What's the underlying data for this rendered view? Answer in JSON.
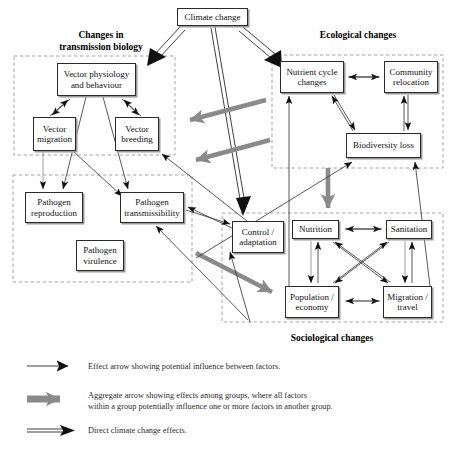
{
  "diagram": {
    "title_box": {
      "label": "Climate change"
    },
    "group_labels": {
      "transmission": "Changes in\ntransmission biology",
      "ecological": "Ecological changes",
      "sociological": "Sociological changes"
    },
    "nodes": [
      {
        "id": "climate-change",
        "label": "Climate change",
        "x": 177,
        "y": 8,
        "w": 71,
        "h": 18,
        "shadow": true
      },
      {
        "id": "vector-physiology",
        "label": "Vector physiology\nand behaviour",
        "x": 57,
        "y": 63,
        "w": 79,
        "h": 33,
        "shadow": true
      },
      {
        "id": "vector-migration",
        "label": "Vector\nmigration",
        "x": 33,
        "y": 117,
        "w": 43,
        "h": 34,
        "shadow": true
      },
      {
        "id": "vector-breeding",
        "label": "Vector\nbreeding",
        "x": 115,
        "y": 117,
        "w": 44,
        "h": 34,
        "shadow": true
      },
      {
        "id": "pathogen-reproduction",
        "label": "Pathogen\nreproduction",
        "x": 25,
        "y": 192,
        "w": 58,
        "h": 31,
        "shadow": true
      },
      {
        "id": "pathogen-transmissibility",
        "label": "Pathogen\ntransmissibility",
        "x": 120,
        "y": 192,
        "w": 64,
        "h": 31,
        "shadow": true
      },
      {
        "id": "pathogen-virulence",
        "label": "Pathogen\nvirulence",
        "x": 76,
        "y": 240,
        "w": 48,
        "h": 31,
        "shadow": true
      },
      {
        "id": "control-adaptation",
        "label": "Control /\nadaptation",
        "x": 232,
        "y": 221,
        "w": 52,
        "h": 32,
        "shadow": true
      },
      {
        "id": "nutrient-cycle-changes",
        "label": "Nutrient cycle\nchanges",
        "x": 280,
        "y": 61,
        "w": 64,
        "h": 32,
        "shadow": true
      },
      {
        "id": "community-relocation",
        "label": "Community\nrelocation",
        "x": 384,
        "y": 61,
        "w": 54,
        "h": 32,
        "shadow": true
      },
      {
        "id": "biodiversity-loss",
        "label": "Biodiversity loss",
        "x": 346,
        "y": 133,
        "w": 75,
        "h": 25,
        "shadow": true
      },
      {
        "id": "nutrition",
        "label": "Nutrition",
        "x": 292,
        "y": 220,
        "w": 47,
        "h": 19,
        "shadow": true
      },
      {
        "id": "sanitation",
        "label": "Sanitation",
        "x": 386,
        "y": 220,
        "w": 46,
        "h": 19,
        "shadow": true
      },
      {
        "id": "population-economy",
        "label": "Population /\neconomy",
        "x": 285,
        "y": 286,
        "w": 54,
        "h": 32,
        "shadow": true
      },
      {
        "id": "migration-travel",
        "label": "Migration /\ntravel",
        "x": 383,
        "y": 286,
        "w": 49,
        "h": 32,
        "shadow": true
      }
    ],
    "group_boxes": [
      {
        "id": "transmission-biology-group",
        "x": 14,
        "y": 56,
        "w": 161,
        "h": 99
      },
      {
        "id": "pathogen-group",
        "x": 13,
        "y": 175,
        "w": 179,
        "h": 107
      },
      {
        "id": "ecological-group",
        "x": 272,
        "y": 55,
        "w": 171,
        "h": 113
      },
      {
        "id": "sociological-group",
        "x": 222,
        "y": 213,
        "w": 221,
        "h": 109
      }
    ],
    "legend": [
      {
        "id": "effect-arrow",
        "type": "thin",
        "text": "Effect arrow showing potential influence between factors."
      },
      {
        "id": "aggregate-arrow",
        "type": "aggregate",
        "text": "Aggregate arrow showing effects among groups, where all factors\nwithin a group potentially influence one or more factors in another group."
      },
      {
        "id": "direct-arrow",
        "type": "direct",
        "text": "Direct climate change effects."
      }
    ],
    "colors": {
      "stroke": "#2b2b2b",
      "aggregate_gray": "#8a8a8a",
      "shadow_gray": "#9a9a9a",
      "background": "#ffffff"
    }
  }
}
